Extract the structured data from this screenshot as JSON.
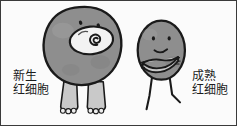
{
  "figure": {
    "border_color": "#3a3a3a",
    "background_color": "#fbfbfb"
  },
  "palette": {
    "cell_fill": "#8e8e8e",
    "cell_fill_light": "#9a9a9a",
    "cell_outline": "#1a1a1a",
    "limb_fill": "#c9c9c9",
    "nucleus_fill": "#f2f2f2",
    "text_color": "#1c1c1c"
  },
  "labels": {
    "newborn": {
      "line1": "新生",
      "line2": "红细胞"
    },
    "mature": {
      "line1": "成熟",
      "line2": "红细胞"
    }
  },
  "characters": {
    "newborn_cell": {
      "name": "新生红细胞",
      "shape": "large-round-blob",
      "features": [
        "dot-eyes",
        "large-open-mouth",
        "spiral-nucleus",
        "two-thick-legs-with-toes"
      ]
    },
    "mature_cell": {
      "name": "成熟红细胞",
      "shape": "small-oval-blob",
      "features": [
        "dot-eyes",
        "small-smile",
        "folded-arms",
        "two-thin-stick-legs"
      ]
    }
  }
}
